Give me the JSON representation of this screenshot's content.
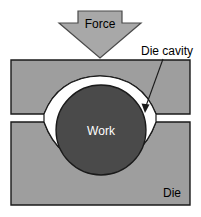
{
  "figure": {
    "type": "technical-diagram",
    "canvas": {
      "width": 201,
      "height": 217,
      "background": "#ffffff"
    },
    "colors": {
      "die_fill": "#9e9e9e",
      "die_stroke": "#1a1a1a",
      "cavity_fill": "#ffffff",
      "work_fill": "#4a4a4a",
      "work_stroke": "#1a1a1a",
      "arrow_fill": "#a8a8a8",
      "arrow_stroke": "#4a4a4a",
      "text_dark": "#000000",
      "text_light": "#ffffff",
      "leader_line": "#1a1a1a"
    },
    "labels": {
      "force": "Force",
      "die_cavity": "Die cavity",
      "work": "Work",
      "die": "Die"
    },
    "parts": [
      {
        "name": "force-arrow",
        "label": "Force",
        "direction": "down"
      },
      {
        "name": "upper-die",
        "label": "Die"
      },
      {
        "name": "lower-die",
        "label": "Die"
      },
      {
        "name": "die-cavity",
        "label": "Die cavity"
      },
      {
        "name": "workpiece",
        "label": "Work"
      }
    ]
  }
}
